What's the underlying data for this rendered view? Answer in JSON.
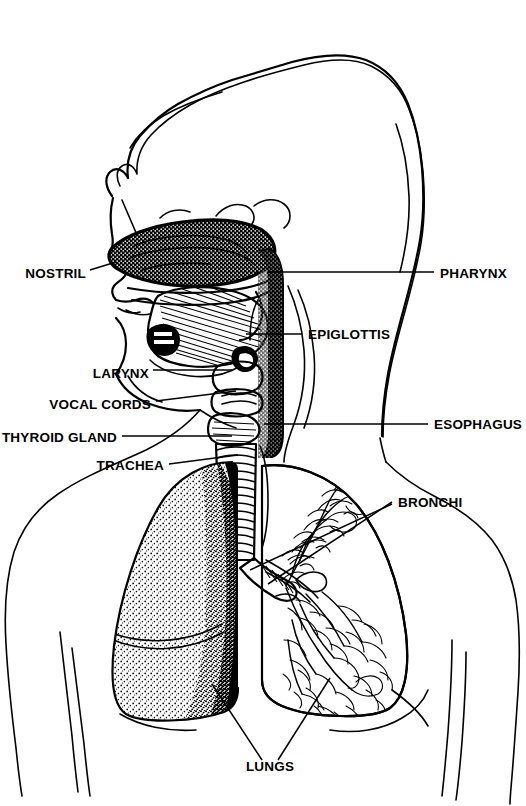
{
  "figure": {
    "style": "black and white ink illustration",
    "background_color": "#ffffff",
    "ink_color": "#000000"
  },
  "labels": {
    "left": [
      {
        "id": "nostril",
        "text": "NOSTRIL",
        "x": 86,
        "y": 273
      },
      {
        "id": "larynx",
        "text": "LARYNX",
        "x": 149,
        "y": 374
      },
      {
        "id": "vocal_cords",
        "text": "VOCAL CORDS",
        "x": 151,
        "y": 405
      },
      {
        "id": "thyroid_gland",
        "text": "THYROID GLAND",
        "x": 117,
        "y": 440
      },
      {
        "id": "trachea",
        "text": "TRACHEA",
        "x": 164,
        "y": 468
      }
    ],
    "right": [
      {
        "id": "pharynx",
        "text": "PHARYNX",
        "x": 440,
        "y": 278
      },
      {
        "id": "epiglottis",
        "text": "EPIGLOTTIS",
        "x": 308,
        "y": 338
      },
      {
        "id": "esophagus",
        "text": "ESOPHAGUS",
        "x": 434,
        "y": 428
      },
      {
        "id": "bronchi",
        "text": "BRONCHI",
        "x": 398,
        "y": 506
      }
    ],
    "bottom": [
      {
        "id": "lungs",
        "text": "LUNGS",
        "x": 270,
        "y": 771
      }
    ]
  },
  "anatomy": {
    "parts": [
      "head outline with wavy hair",
      "nasal cavity",
      "hard palate",
      "tongue",
      "pharynx",
      "epiglottis",
      "larynx",
      "vocal cords",
      "thyroid gland",
      "trachea with cartilage rings",
      "esophagus",
      "left lung (stippled)",
      "right lung (bronchial tree)",
      "bronchi",
      "torso and arms outline"
    ]
  }
}
